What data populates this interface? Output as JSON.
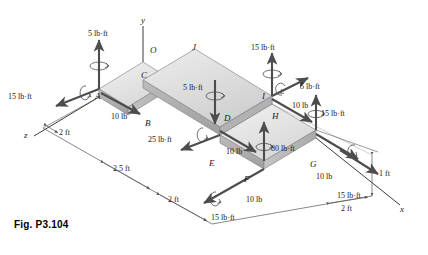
{
  "figure": {
    "caption": "Fig. P3.104",
    "colors": {
      "top_face": "#e8e8e8",
      "side_face": "#c9c9c9",
      "front_face": "#b5b5b5",
      "arrow": "#4d4d4d",
      "dimension_line": "#555555",
      "text": "#1a1a1a",
      "background": "#ffffff"
    }
  },
  "axes": [
    {
      "name": "y",
      "label": "y"
    },
    {
      "name": "x",
      "label": "x"
    },
    {
      "name": "z",
      "label": "z"
    }
  ],
  "points": [
    {
      "id": "O",
      "label": "O"
    },
    {
      "id": "A",
      "label": "A"
    },
    {
      "id": "B",
      "label": "B"
    },
    {
      "id": "C",
      "label": "C"
    },
    {
      "id": "D",
      "label": "D"
    },
    {
      "id": "E",
      "label": "E"
    },
    {
      "id": "F",
      "label": "F"
    },
    {
      "id": "G",
      "label": "G"
    },
    {
      "id": "H",
      "label": "H"
    },
    {
      "id": "I",
      "label": "I"
    },
    {
      "id": "J",
      "label": "J"
    }
  ],
  "loads": [
    {
      "id": "couple-a-vertical",
      "label": "5 lb·ft",
      "at": "A",
      "kind": "couple"
    },
    {
      "id": "couple-a-z",
      "label": "15 lb·ft",
      "at": "A",
      "kind": "couple"
    },
    {
      "id": "force-ab",
      "label": "10 lb",
      "at": "A",
      "kind": "force"
    },
    {
      "id": "couple-b",
      "label": "25 lb·ft",
      "at": "B",
      "kind": "couple"
    },
    {
      "id": "couple-d",
      "label": "5 lb·ft",
      "at": "D",
      "kind": "couple"
    },
    {
      "id": "force-de",
      "label": "10 lb",
      "at": "D",
      "kind": "force"
    },
    {
      "id": "couple-f",
      "label": "15 lb·ft",
      "at": "F",
      "kind": "couple"
    },
    {
      "id": "force-f",
      "label": "10 lb",
      "at": "F",
      "kind": "force"
    },
    {
      "id": "couple-f-vertical",
      "label": "80 lb·ft",
      "at": "F",
      "kind": "couple"
    },
    {
      "id": "couple-i-vertical",
      "label": "15 lb·ft",
      "at": "I",
      "kind": "couple"
    },
    {
      "id": "couple-i-diag",
      "label": "5 lb·ft",
      "at": "I",
      "kind": "couple"
    },
    {
      "id": "force-ih",
      "label": "10 lb",
      "at": "I",
      "kind": "force"
    },
    {
      "id": "couple-g-vertical",
      "label": "15 lb·ft",
      "at": "G",
      "kind": "couple"
    },
    {
      "id": "force-g",
      "label": "10 lb",
      "at": "G",
      "kind": "force"
    },
    {
      "id": "couple-g-x",
      "label": "15 lb·ft",
      "at": "G",
      "kind": "couple"
    }
  ],
  "dimensions": [
    {
      "id": "dim-2ft-z-upper",
      "label": "2 ft"
    },
    {
      "id": "dim-2p5ft",
      "label": "2.5 ft"
    },
    {
      "id": "dim-2ft-lower",
      "label": "2 ft"
    },
    {
      "id": "dim-2ft-x",
      "label": "2 ft"
    },
    {
      "id": "dim-1ft",
      "label": "1 ft"
    }
  ]
}
